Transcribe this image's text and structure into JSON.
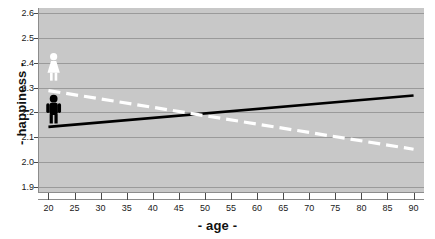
{
  "chart_data": {
    "type": "line",
    "title": "",
    "xlabel": "- age -",
    "ylabel": "- happiness -",
    "xlim": [
      18,
      92
    ],
    "ylim": [
      1.88,
      2.62
    ],
    "xticks": [
      20,
      25,
      30,
      35,
      40,
      45,
      50,
      55,
      60,
      65,
      70,
      75,
      80,
      85,
      90
    ],
    "yticks": [
      "1.9",
      "2.0",
      "2.1",
      "2.2",
      "2.3",
      "2.4",
      "2.5",
      "2.6"
    ],
    "grid": true,
    "legend": "none",
    "plot_background": "#c8c8c8",
    "gridline_color": "#9a9a9a",
    "series": [
      {
        "name": "men",
        "style": "solid",
        "color": "#000000",
        "x": [
          20,
          90
        ],
        "values": [
          2.142,
          2.268
        ]
      },
      {
        "name": "women",
        "style": "dashed",
        "color": "#ffffff",
        "x": [
          20,
          90
        ],
        "values": [
          2.288,
          2.052
        ]
      }
    ],
    "annotations": [
      {
        "name": "woman-pictogram",
        "icon": "female-figure-icon",
        "color": "#ffffff",
        "x": 21,
        "y": 2.372
      },
      {
        "name": "man-pictogram",
        "icon": "male-figure-icon",
        "color": "#000000",
        "x": 21,
        "y": 2.203
      }
    ],
    "crossover": {
      "x": 47,
      "y": 2.2
    }
  }
}
